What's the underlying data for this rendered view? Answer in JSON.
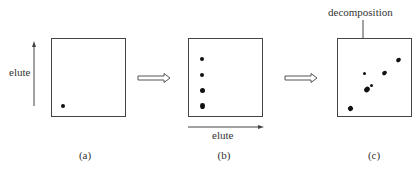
{
  "diagram": {
    "panels": [
      {
        "id": "a",
        "caption": "(a)",
        "axis_label": "elute",
        "axis_direction": "vertical-up",
        "spots": [
          {
            "x": 9,
            "y": 65,
            "w": 4,
            "h": 4
          }
        ]
      },
      {
        "id": "b",
        "caption": "(b)",
        "axis_label": "elute",
        "axis_direction": "horizontal-right",
        "spots": [
          {
            "x": 11,
            "y": 18,
            "w": 4,
            "h": 4
          },
          {
            "x": 11,
            "y": 34,
            "w": 4,
            "h": 4
          },
          {
            "x": 11,
            "y": 49,
            "w": 5,
            "h": 5
          },
          {
            "x": 11,
            "y": 65,
            "w": 5,
            "h": 5
          }
        ]
      },
      {
        "id": "c",
        "caption": "(c)",
        "annotation": "decomposition",
        "spots": [
          {
            "x": 58,
            "y": 19,
            "w": 5,
            "h": 4
          },
          {
            "x": 44,
            "y": 32,
            "w": 5,
            "h": 4
          },
          {
            "x": 25,
            "y": 33,
            "w": 3,
            "h": 3
          },
          {
            "x": 32,
            "y": 45,
            "w": 3,
            "h": 3
          },
          {
            "x": 26,
            "y": 48,
            "w": 6,
            "h": 5
          },
          {
            "x": 10,
            "y": 67,
            "w": 5,
            "h": 5
          }
        ]
      }
    ],
    "arrows": [
      {
        "from": "a",
        "to": "b",
        "style": "hollow-double"
      },
      {
        "from": "b",
        "to": "c",
        "style": "hollow-double"
      }
    ]
  }
}
